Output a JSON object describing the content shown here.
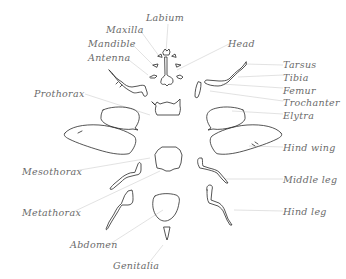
{
  "diagram": {
    "colors": {
      "outline": "#2a2a2a",
      "leader": "#cfcfcf",
      "label": "#6a6a6a",
      "background": "#ffffff"
    },
    "labels": {
      "labium": "Labium",
      "maxilla": "Maxilla",
      "mandible": "Mandible",
      "antenna": "Antenna",
      "head": "Head",
      "tarsus": "Tarsus",
      "tibia": "Tibia",
      "femur": "Femur",
      "trochanter": "Trochanter",
      "elytra": "Elytra",
      "prothorax": "Prothorax",
      "hind_wing": "Hind wing",
      "mesothorax": "Mesothorax",
      "middle_leg": "Middle leg",
      "metathorax": "Metathorax",
      "hind_leg": "Hind leg",
      "abdomen": "Abdomen",
      "genitalia": "Genitalia"
    }
  }
}
